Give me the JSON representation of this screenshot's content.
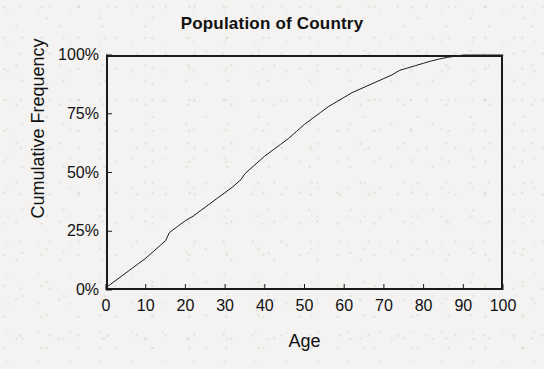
{
  "chart_data": {
    "type": "line",
    "title": "Population of Country",
    "xlabel": "Age",
    "ylabel": "Cumulative Frequency",
    "xlim": [
      0,
      100
    ],
    "ylim": [
      0,
      100
    ],
    "grid": false,
    "legend": "none",
    "xticks": [
      "0",
      "10",
      "20",
      "30",
      "40",
      "50",
      "60",
      "70",
      "80",
      "90",
      "100"
    ],
    "xtick_values": [
      0,
      10,
      20,
      30,
      40,
      50,
      60,
      70,
      80,
      90,
      100
    ],
    "yticks": [
      "0%",
      "25%",
      "50%",
      "75%",
      "100%"
    ],
    "ytick_values": [
      0,
      25,
      50,
      75,
      100
    ],
    "line_color": "#1a1a1a",
    "series": [
      {
        "name": "Cumulative Frequency",
        "x": [
          0,
          2,
          4,
          6,
          8,
          10,
          12,
          14,
          15,
          16,
          18,
          20,
          22,
          24,
          26,
          28,
          30,
          32,
          34,
          35,
          36,
          38,
          40,
          42,
          44,
          46,
          48,
          50,
          52,
          54,
          56,
          58,
          60,
          62,
          64,
          66,
          68,
          70,
          72,
          74,
          75,
          76,
          78,
          80,
          82,
          84,
          86,
          88,
          90,
          92,
          94,
          96,
          98,
          100
        ],
        "values": [
          1,
          3.5,
          6,
          8.5,
          11,
          13.5,
          16.5,
          19.5,
          21,
          24.5,
          27,
          29.5,
          31.5,
          34,
          36.5,
          39,
          41.5,
          44,
          47,
          49.5,
          51,
          54,
          57,
          59.5,
          62,
          64.5,
          67.5,
          70.5,
          73,
          75.5,
          78,
          80,
          82,
          84,
          85.5,
          87,
          88.5,
          90,
          91.5,
          93.5,
          94,
          94.5,
          95.5,
          96.5,
          97.5,
          98.3,
          99,
          99.5,
          100,
          100,
          100,
          100,
          100,
          100
        ]
      }
    ]
  },
  "axis": {
    "tick_length_px": 6
  }
}
